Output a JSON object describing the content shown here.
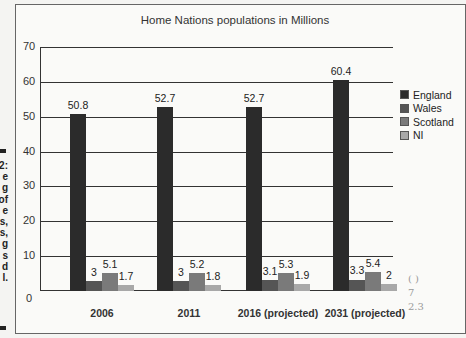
{
  "page": {
    "side_caption_letters": [
      "2:",
      "e",
      "g",
      "of",
      "e",
      "s,",
      "s,",
      "g",
      "s",
      "d",
      "l."
    ],
    "handwritten_notes": [
      "( )",
      "7",
      "2.3"
    ]
  },
  "chart_data": {
    "type": "bar",
    "title": "Home Nations populations in Millions",
    "xlabel": "",
    "ylabel": "",
    "ylim": [
      0,
      70
    ],
    "yticks": [
      0,
      10,
      20,
      30,
      40,
      50,
      60,
      70
    ],
    "grid": true,
    "legend_position": "right",
    "categories": [
      "2006",
      "2011",
      "2016 (projected)",
      "2031 (projected)"
    ],
    "series": [
      {
        "name": "England",
        "color": "#2b2b2b",
        "values": [
          50.8,
          52.7,
          52.7,
          60.4
        ],
        "labels": [
          "50.8",
          "52.7",
          "52.7",
          "60.4"
        ]
      },
      {
        "name": "Wales",
        "color": "#555555",
        "values": [
          3,
          3,
          3.1,
          3.3
        ],
        "labels": [
          "3",
          "3",
          "3.1",
          "3.3"
        ]
      },
      {
        "name": "Scotland",
        "color": "#7a7a7a",
        "values": [
          5.1,
          5.2,
          5.3,
          5.4
        ],
        "labels": [
          "5.1",
          "5.2",
          "5.3",
          "5.4"
        ]
      },
      {
        "name": "NI",
        "color": "#a8a8a8",
        "values": [
          1.7,
          1.8,
          1.9,
          2
        ],
        "labels": [
          "1.7",
          "1.8",
          "1.9",
          "2"
        ]
      }
    ],
    "note": "Bar heights in source image are drawn inconsistently with labels (e.g. 2016 England labelled 52.7 but drawn ~56); labelled values recorded."
  }
}
